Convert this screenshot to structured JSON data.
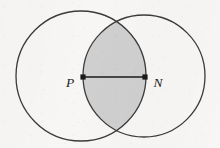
{
  "figure": {
    "caption": "",
    "canvas": {
      "width": 220,
      "height": 148
    },
    "background_color": "#f7f6f4",
    "stroke_color": "#3a3a3a",
    "stroke_width": 1.3,
    "shade_color": "#cfcfcf",
    "marker_color": "#1a1a1a",
    "label_color": "#1c1c1c"
  },
  "shapes": {
    "left_circle": {
      "name": "circle-left",
      "center_x": 81,
      "center_y": 76,
      "radius": 65,
      "fill": "none"
    },
    "right_circle": {
      "name": "circle-right",
      "center_x": 144,
      "center_y": 76,
      "radius": 61,
      "fill": "none"
    },
    "lens": {
      "name": "intersection-lens",
      "fill": "#cfcfcf",
      "left_x": 83,
      "right_x": 145,
      "top_y": 17,
      "bottom_y": 134
    },
    "segment_pn": {
      "name": "segment-PN",
      "x1": 83,
      "y1": 77,
      "x2": 145,
      "y2": 77
    }
  },
  "points": [
    {
      "id": "P",
      "label": "P",
      "x": 83,
      "y": 77,
      "label_x": 70,
      "label_y": 87,
      "marker": "square-dot"
    },
    {
      "id": "N",
      "label": "N",
      "x": 145,
      "y": 77,
      "label_x": 158,
      "label_y": 87,
      "marker": "square-dot"
    }
  ]
}
